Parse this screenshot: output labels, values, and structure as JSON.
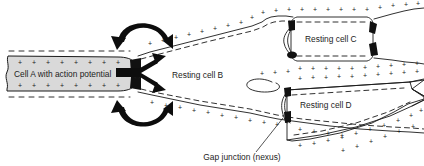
{
  "figure": {
    "width": 424,
    "height": 166,
    "background": "#ffffff",
    "line_color": "#1a1a1a",
    "cell_a_fill": "#d9d9d9",
    "junction_color": "#111111"
  },
  "labels": {
    "cell_a": "Cell A with action potential",
    "cell_b": "Resting cell B",
    "cell_c": "Resting cell C",
    "cell_d": "Resting cell D",
    "gap_junction": "Gap junction (nexus)"
  },
  "charge_symbols": {
    "positive": "+",
    "negative": "–"
  },
  "icons": {
    "curved_arrow_top": "curved-arrow-icon",
    "curved_arrow_bottom": "curved-arrow-icon",
    "current_arrow_upper": "arrow-icon",
    "current_arrow_lower": "arrow-icon",
    "gap_junction_marker": "gap-junction-icon",
    "leader_line": "leader-line-icon"
  }
}
